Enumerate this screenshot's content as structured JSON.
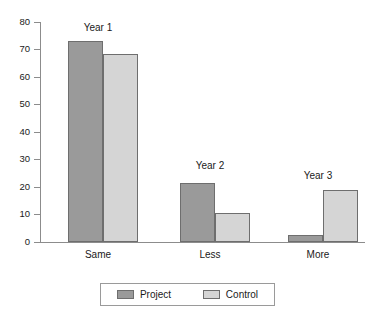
{
  "chart_data": {
    "type": "bar",
    "title": "",
    "subtitle": "",
    "xlabel": "",
    "ylabel": "",
    "ylim": [
      0,
      80
    ],
    "yticks": [
      0,
      10,
      20,
      30,
      40,
      50,
      60,
      70,
      80
    ],
    "grid": false,
    "legend_position": "bottom",
    "categories": [
      "Same",
      "Less",
      "More"
    ],
    "group_annotations": [
      "Year 1",
      "Year 2",
      "Year 3"
    ],
    "series": [
      {
        "name": "Project",
        "color": "#9a9a9a",
        "values": [
          73,
          21.5,
          2.5
        ]
      },
      {
        "name": "Control",
        "color": "#d5d5d5",
        "values": [
          68.5,
          10.5,
          19
        ]
      }
    ]
  },
  "legend": {
    "entries": [
      {
        "label": "Project",
        "swatch": "project-swatch"
      },
      {
        "label": "Control",
        "swatch": "control-swatch"
      }
    ]
  },
  "axis": {
    "y_tick_labels": [
      "80",
      "70",
      "60",
      "50",
      "40",
      "30",
      "20",
      "10",
      "0"
    ],
    "x_tick_labels": [
      "Same",
      "Less",
      "More"
    ]
  },
  "annotations": {
    "group1": "Year 1",
    "group2": "Year 2",
    "group3": "Year 3"
  },
  "colors": {
    "project": "#9a9a9a",
    "control": "#d5d5d5",
    "axis": "#8c8c8c",
    "bar_border": "#6e6e6e",
    "text": "#1a1a1a",
    "background": "#ffffff"
  }
}
